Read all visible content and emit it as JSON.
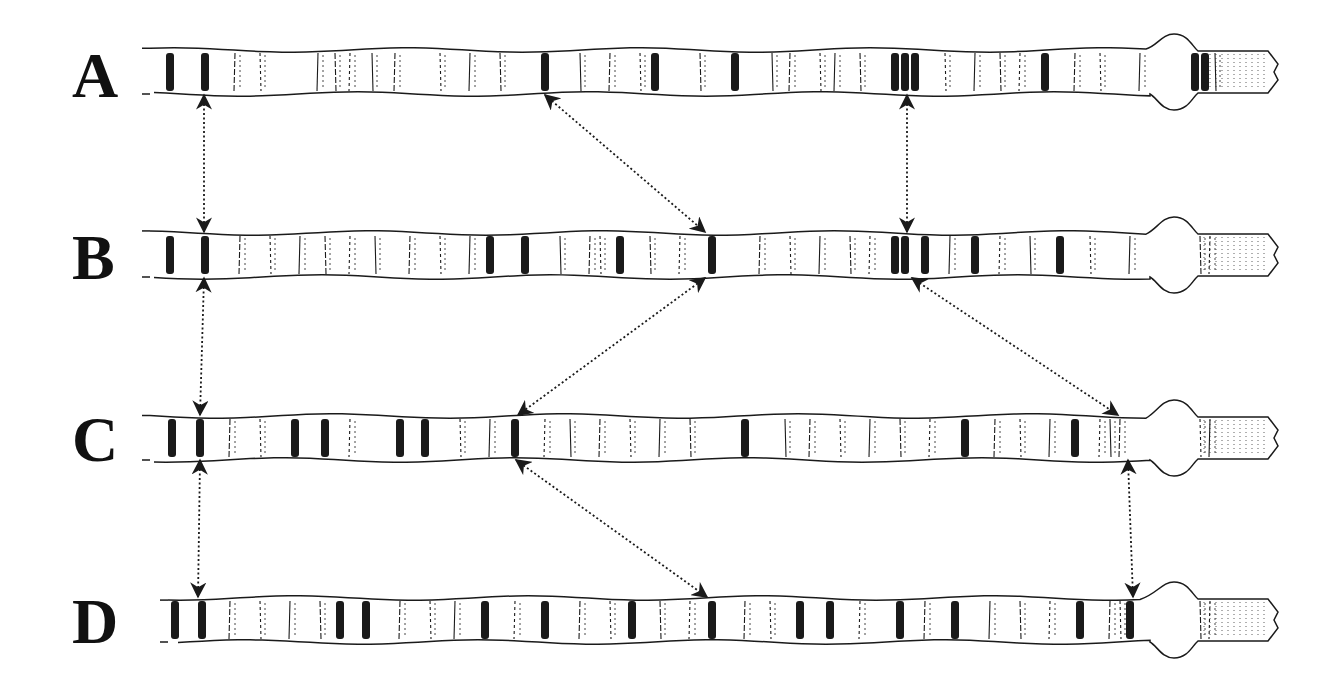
{
  "figure": {
    "rows": [
      {
        "label": "A",
        "y": 72,
        "x_start": 150,
        "x_end": 1278,
        "bulge_x": 1172,
        "bands": [
          170,
          205,
          235,
          260,
          318,
          335,
          350,
          372,
          395,
          440,
          470,
          500,
          545,
          580,
          610,
          640,
          655,
          700,
          735,
          772,
          790,
          820,
          835,
          860,
          895,
          905,
          915,
          945,
          975,
          1000,
          1020,
          1045,
          1075,
          1100,
          1140,
          1195,
          1205,
          1215
        ],
        "dark": [
          170,
          205,
          545,
          655,
          735,
          895,
          905,
          915,
          1045,
          1195,
          1205
        ]
      },
      {
        "label": "B",
        "y": 255,
        "x_start": 150,
        "x_end": 1278,
        "bulge_x": 1172,
        "bands": [
          170,
          205,
          240,
          270,
          300,
          325,
          350,
          375,
          410,
          440,
          470,
          490,
          525,
          560,
          590,
          600,
          620,
          650,
          680,
          712,
          760,
          790,
          820,
          850,
          870,
          895,
          905,
          925,
          950,
          975,
          1000,
          1030,
          1060,
          1090,
          1130,
          1200,
          1210
        ],
        "dark": [
          170,
          205,
          490,
          525,
          595,
          620,
          712,
          895,
          905,
          925,
          975,
          1060,
          1205
        ]
      },
      {
        "label": "C",
        "y": 438,
        "x_start": 150,
        "x_end": 1278,
        "bulge_x": 1172,
        "bands": [
          172,
          200,
          230,
          260,
          295,
          325,
          350,
          400,
          425,
          460,
          490,
          515,
          545,
          570,
          600,
          630,
          660,
          690,
          745,
          785,
          810,
          840,
          870,
          900,
          930,
          965,
          995,
          1020,
          1050,
          1075,
          1100,
          1110,
          1120,
          1200,
          1210
        ],
        "dark": [
          172,
          200,
          295,
          325,
          400,
          425,
          515,
          745,
          965,
          1075,
          1105,
          1115,
          1205
        ]
      },
      {
        "label": "D",
        "y": 620,
        "x_start": 168,
        "x_end": 1278,
        "bulge_x": 1172,
        "bands": [
          175,
          202,
          230,
          260,
          290,
          320,
          340,
          366,
          400,
          430,
          455,
          485,
          515,
          545,
          580,
          610,
          632,
          660,
          690,
          712,
          745,
          770,
          800,
          830,
          860,
          900,
          925,
          955,
          990,
          1020,
          1050,
          1080,
          1110,
          1120,
          1130,
          1200,
          1210
        ],
        "dark": [
          175,
          202,
          340,
          366,
          485,
          545,
          632,
          712,
          800,
          830,
          900,
          955,
          1080,
          1115,
          1130,
          1205
        ]
      }
    ],
    "correspondences": [
      {
        "from": [
          204,
          95
        ],
        "to": [
          204,
          232
        ]
      },
      {
        "from": [
          545,
          95
        ],
        "to": [
          705,
          232
        ]
      },
      {
        "from": [
          907,
          95
        ],
        "to": [
          907,
          232
        ]
      },
      {
        "from": [
          204,
          278
        ],
        "to": [
          200,
          415
        ]
      },
      {
        "from": [
          705,
          278
        ],
        "to": [
          518,
          415
        ]
      },
      {
        "from": [
          912,
          278
        ],
        "to": [
          1118,
          415
        ]
      },
      {
        "from": [
          200,
          460
        ],
        "to": [
          198,
          597
        ]
      },
      {
        "from": [
          516,
          460
        ],
        "to": [
          707,
          597
        ]
      },
      {
        "from": [
          1128,
          460
        ],
        "to": [
          1133,
          597
        ]
      }
    ],
    "colors": {
      "ink": "#1a1a1a",
      "background": "#ffffff"
    }
  }
}
